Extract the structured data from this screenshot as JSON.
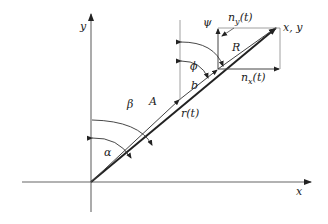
{
  "diagram": {
    "type": "vector-geometry",
    "axes": {
      "x_label": "x",
      "y_label": "y"
    },
    "vectors": {
      "A": "A",
      "b": "b",
      "R": "R",
      "r": "r(t)",
      "nx": "n_x(t)",
      "ny": "n_y(t)",
      "tip": "x, y"
    },
    "angles": {
      "alpha": "α",
      "beta": "β",
      "phi": "ϕ",
      "psi": "ψ"
    },
    "labels": {
      "x_axis": "x",
      "y_axis": "y",
      "A": "A",
      "b": "b",
      "R": "R",
      "r_t": "r(t)",
      "alpha": "α",
      "beta": "β",
      "phi": "ϕ",
      "psi": "ψ",
      "nx_base": "n",
      "nx_sub": "x",
      "nx_arg": "(t)",
      "ny_base": "n",
      "ny_sub": "y",
      "ny_arg": "(t)",
      "tip": "x, y"
    },
    "colors": {
      "line": "#333333",
      "axis": "#555555",
      "background": "#ffffff"
    }
  }
}
